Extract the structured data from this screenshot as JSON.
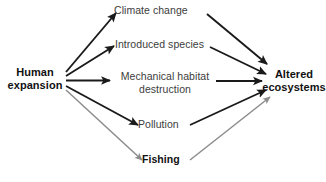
{
  "diagram": {
    "type": "flow-diagram",
    "background_color": "#ffffff",
    "text_color": "#3c3c3c",
    "emphasis_text_color": "#111111",
    "edge_color_strong": "#1a1a1a",
    "edge_color_weak": "#8c8c8c",
    "nodes": [
      {
        "id": "human-expansion",
        "label": "Human\nexpansion",
        "emphasis": "bold",
        "role": "source"
      },
      {
        "id": "climate-change",
        "label": "Climate change",
        "emphasis": "regular",
        "role": "driver"
      },
      {
        "id": "introduced-species",
        "label": "Introduced species",
        "emphasis": "regular",
        "role": "driver"
      },
      {
        "id": "mechanical-habitat-destruction",
        "label": "Mechanical habitat\ndestruction",
        "emphasis": "regular",
        "role": "driver"
      },
      {
        "id": "pollution",
        "label": "Pollution",
        "emphasis": "regular",
        "role": "driver"
      },
      {
        "id": "fishing",
        "label": "Fishing",
        "emphasis": "bold",
        "role": "driver"
      },
      {
        "id": "altered-ecosystems",
        "label": "Altered\necosystems",
        "emphasis": "bold",
        "role": "sink"
      }
    ],
    "edges": [
      {
        "from": "human-expansion",
        "to": "climate-change",
        "style": "strong"
      },
      {
        "from": "human-expansion",
        "to": "introduced-species",
        "style": "strong"
      },
      {
        "from": "human-expansion",
        "to": "mechanical-habitat-destruction",
        "style": "strong"
      },
      {
        "from": "human-expansion",
        "to": "pollution",
        "style": "strong"
      },
      {
        "from": "human-expansion",
        "to": "fishing",
        "style": "weak"
      },
      {
        "from": "climate-change",
        "to": "altered-ecosystems",
        "style": "strong"
      },
      {
        "from": "introduced-species",
        "to": "altered-ecosystems",
        "style": "strong"
      },
      {
        "from": "mechanical-habitat-destruction",
        "to": "altered-ecosystems",
        "style": "strong"
      },
      {
        "from": "pollution",
        "to": "altered-ecosystems",
        "style": "strong"
      },
      {
        "from": "fishing",
        "to": "altered-ecosystems",
        "style": "weak"
      }
    ]
  }
}
